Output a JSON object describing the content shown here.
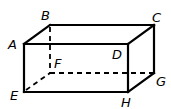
{
  "diagram": {
    "vertices": {
      "A": {
        "label": "A",
        "x": 24,
        "y": 44,
        "lx": 8,
        "ly": 49
      },
      "B": {
        "label": "B",
        "x": 50,
        "y": 25,
        "lx": 41,
        "ly": 20
      },
      "C": {
        "label": "C",
        "x": 154,
        "y": 25,
        "lx": 152,
        "ly": 22
      },
      "D": {
        "label": "D",
        "x": 128,
        "y": 44,
        "lx": 112,
        "ly": 59
      },
      "E": {
        "label": "E",
        "x": 24,
        "y": 92,
        "lx": 10,
        "ly": 100
      },
      "F": {
        "label": "F",
        "x": 50,
        "y": 73,
        "lx": 54,
        "ly": 68
      },
      "G": {
        "label": "G",
        "x": 154,
        "y": 73,
        "lx": 156,
        "ly": 86
      },
      "H": {
        "label": "H",
        "x": 128,
        "y": 92,
        "lx": 121,
        "ly": 107
      }
    },
    "solid_edges": [
      "AB",
      "BC",
      "CD",
      "DA",
      "AE",
      "DH",
      "EH",
      "CG",
      "GH"
    ],
    "dashed_edges": [
      "BF",
      "EF",
      "FG"
    ]
  }
}
